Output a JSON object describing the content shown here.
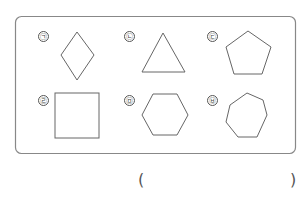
{
  "question": {
    "options": [
      {
        "label": "㉠",
        "shape": "rhombus",
        "sides": 4
      },
      {
        "label": "㉡",
        "shape": "triangle",
        "sides": 3
      },
      {
        "label": "㉢",
        "shape": "pentagon",
        "sides": 5
      },
      {
        "label": "㉣",
        "shape": "square",
        "sides": 4
      },
      {
        "label": "㉤",
        "shape": "hexagon",
        "sides": 6
      },
      {
        "label": "㉥",
        "shape": "heptagon",
        "sides": 7
      }
    ],
    "answer_open": "(",
    "answer_close": ")",
    "answer_value": ""
  },
  "colors": {
    "stroke": "#666666",
    "box_border": "#777777",
    "background": "#ffffff"
  }
}
